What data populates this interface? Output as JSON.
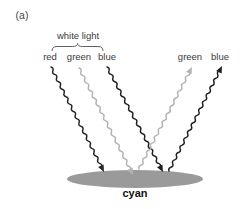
{
  "panel_label": "(a)",
  "source_group_label": "white light",
  "incident_rays": [
    {
      "label": "red",
      "color": "#262626"
    },
    {
      "label": "green",
      "color": "#b3b3b3"
    },
    {
      "label": "blue",
      "color": "#1f1f1f"
    }
  ],
  "reflected_rays": [
    {
      "label": "green",
      "color": "#b3b3b3"
    },
    {
      "label": "blue",
      "color": "#1f1f1f"
    }
  ],
  "surface": {
    "label": "cyan",
    "fill": "#9a9a9a"
  },
  "styles": {
    "brace_color": "#5f5f5f",
    "label_color": "#3a3a3a",
    "surface_label_color": "#111111",
    "background": "#ffffff"
  }
}
